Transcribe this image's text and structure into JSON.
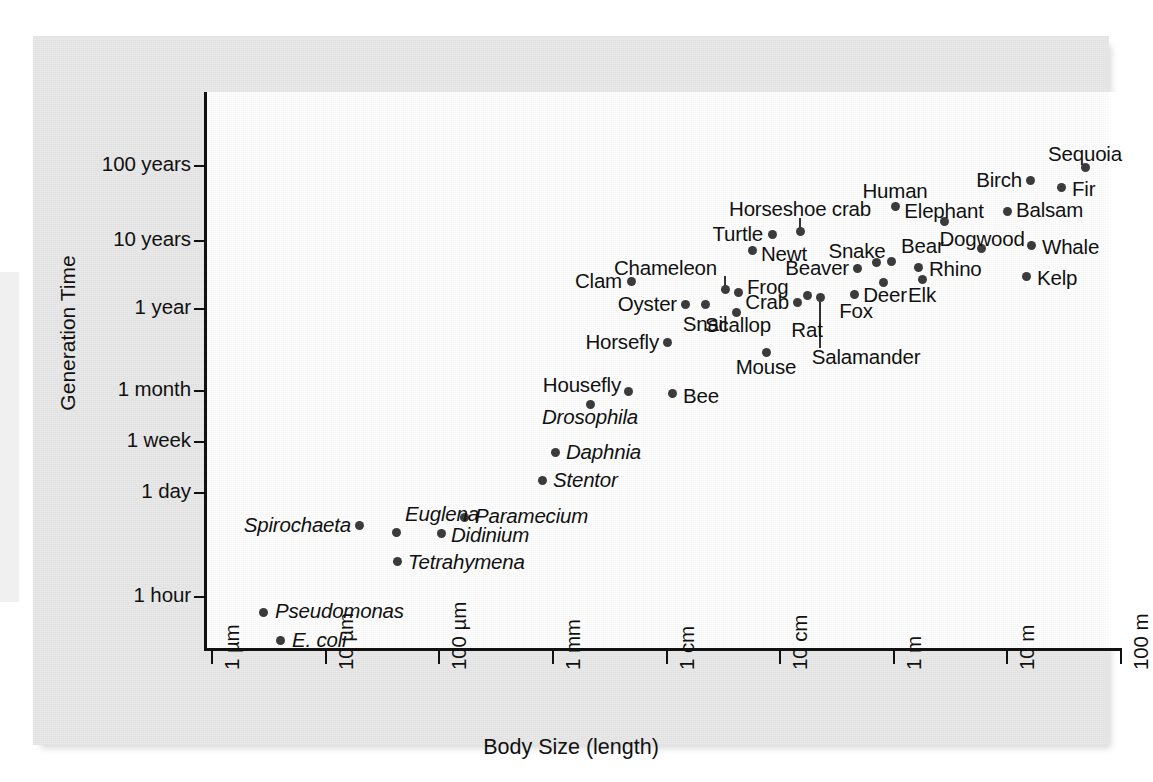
{
  "chart_data": {
    "type": "scatter",
    "title": "",
    "xlabel": "Body Size (length)",
    "ylabel": "Generation Time",
    "grid": false,
    "legend": "none",
    "x_scale": "log",
    "y_scale": "log",
    "x_tick_labels": [
      "1 µm",
      "10 µm",
      "100 µm",
      "1 mm",
      "1 cm",
      "10 cm",
      "1 m",
      "10 m",
      "100 m"
    ],
    "y_tick_labels": [
      "100 years",
      "10 years",
      "1 year",
      "1 month",
      "1 week",
      "1 day",
      "1 hour"
    ],
    "xlim": [
      "1 µm",
      "100 m"
    ],
    "ylim": [
      "below 1 hour",
      "above 100 years"
    ],
    "point_color": "#3c3c3c",
    "panel_color": "#e9e9e9",
    "plot_color": "#ffffff",
    "axis_color": "#111111",
    "points": [
      {
        "name": "E. coli",
        "italic": true,
        "px": 247,
        "py": 604,
        "lx": 259,
        "ly": 604,
        "anchor": "left"
      },
      {
        "name": "Pseudomonas",
        "italic": true,
        "px": 230,
        "py": 576,
        "lx": 242,
        "ly": 575,
        "anchor": "left"
      },
      {
        "name": "Spirochaeta",
        "italic": true,
        "px": 326,
        "py": 489,
        "lx": 318,
        "ly": 489,
        "anchor": "right"
      },
      {
        "name": "Euglena",
        "italic": true,
        "px": 363,
        "py": 496,
        "lx": 372,
        "ly": 478,
        "anchor": "left"
      },
      {
        "name": "Tetrahymena",
        "italic": true,
        "px": 364,
        "py": 525,
        "lx": 375,
        "ly": 526,
        "anchor": "left"
      },
      {
        "name": "Didinium",
        "italic": true,
        "px": 408,
        "py": 497,
        "lx": 418,
        "ly": 499,
        "anchor": "left"
      },
      {
        "name": "Paramecium",
        "italic": true,
        "px": 431,
        "py": 481,
        "lx": 442,
        "ly": 480,
        "anchor": "left"
      },
      {
        "name": "Stentor",
        "italic": true,
        "px": 509,
        "py": 444,
        "lx": 520,
        "ly": 444,
        "anchor": "left"
      },
      {
        "name": "Daphnia",
        "italic": true,
        "px": 522,
        "py": 416,
        "lx": 533,
        "ly": 416,
        "anchor": "left"
      },
      {
        "name": "Drosophila",
        "italic": true,
        "px": 557,
        "py": 368,
        "lx": 557,
        "ly": 381,
        "anchor": "center"
      },
      {
        "name": "Housefly",
        "italic": false,
        "px": 595,
        "py": 355,
        "lx": 588,
        "ly": 349,
        "anchor": "right"
      },
      {
        "name": "Bee",
        "italic": false,
        "px": 639,
        "py": 357,
        "lx": 650,
        "ly": 360,
        "anchor": "left"
      },
      {
        "name": "Horsefly",
        "italic": false,
        "px": 634,
        "py": 306,
        "lx": 626,
        "ly": 306,
        "anchor": "right"
      },
      {
        "name": "Clam",
        "italic": false,
        "px": 598,
        "py": 245,
        "lx": 589,
        "ly": 245,
        "anchor": "right"
      },
      {
        "name": "Oyster",
        "italic": false,
        "px": 652,
        "py": 268,
        "lx": 644,
        "ly": 268,
        "anchor": "right"
      },
      {
        "name": "Snail",
        "italic": false,
        "px": 672,
        "py": 268,
        "lx": 672,
        "ly": 288,
        "anchor": "center"
      },
      {
        "name": "Scallop",
        "italic": false,
        "px": 703,
        "py": 276,
        "lx": 705,
        "ly": 289,
        "anchor": "center"
      },
      {
        "name": "Chameleon",
        "italic": false,
        "px": 692,
        "py": 253,
        "lx": 684,
        "ly": 232,
        "anchor": "right"
      },
      {
        "name": "Frog",
        "italic": false,
        "px": 705,
        "py": 256,
        "lx": 714,
        "ly": 251,
        "anchor": "left"
      },
      {
        "name": "Crab",
        "italic": false,
        "px": 764,
        "py": 266,
        "lx": 756,
        "ly": 266,
        "anchor": "right"
      },
      {
        "name": "Mouse",
        "italic": false,
        "px": 733,
        "py": 316,
        "lx": 733,
        "ly": 331,
        "anchor": "center"
      },
      {
        "name": "Rat",
        "italic": false,
        "px": 774,
        "py": 259,
        "lx": 774,
        "ly": 294,
        "anchor": "center"
      },
      {
        "name": "Salamander",
        "italic": false,
        "px": 787,
        "py": 261,
        "lx": 833,
        "ly": 321,
        "anchor": "center"
      },
      {
        "name": "Newt",
        "italic": false,
        "px": 719,
        "py": 214,
        "lx": 728,
        "ly": 218,
        "anchor": "left"
      },
      {
        "name": "Turtle",
        "italic": false,
        "px": 739,
        "py": 198,
        "lx": 730,
        "ly": 198,
        "anchor": "right"
      },
      {
        "name": "Horseshoe crab",
        "italic": false,
        "px": 767,
        "py": 195,
        "lx": 767,
        "ly": 173,
        "anchor": "center"
      },
      {
        "name": "Beaver",
        "italic": false,
        "px": 824,
        "py": 232,
        "lx": 816,
        "ly": 232,
        "anchor": "right"
      },
      {
        "name": "Snake",
        "italic": false,
        "px": 843,
        "py": 226,
        "lx": 824,
        "ly": 215,
        "anchor": "center"
      },
      {
        "name": "Bear",
        "italic": false,
        "px": 858,
        "py": 225,
        "lx": 868,
        "ly": 210,
        "anchor": "left"
      },
      {
        "name": "Rhino",
        "italic": false,
        "px": 885,
        "py": 231,
        "lx": 896,
        "ly": 233,
        "anchor": "left"
      },
      {
        "name": "Deer",
        "italic": false,
        "px": 850,
        "py": 246,
        "lx": 852,
        "ly": 259,
        "anchor": "center"
      },
      {
        "name": "Elk",
        "italic": false,
        "px": 889,
        "py": 243,
        "lx": 889,
        "ly": 259,
        "anchor": "center"
      },
      {
        "name": "Fox",
        "italic": false,
        "px": 821,
        "py": 258,
        "lx": 823,
        "ly": 275,
        "anchor": "center"
      },
      {
        "name": "Human",
        "italic": false,
        "px": 862,
        "py": 170,
        "lx": 862,
        "ly": 155,
        "anchor": "center"
      },
      {
        "name": "Elephant",
        "italic": false,
        "px": 911,
        "py": 185,
        "lx": 911,
        "ly": 175,
        "anchor": "center"
      },
      {
        "name": "Dogwood",
        "italic": false,
        "px": 948,
        "py": 212,
        "lx": 949,
        "ly": 203,
        "anchor": "center"
      },
      {
        "name": "Balsam",
        "italic": false,
        "px": 974,
        "py": 175,
        "lx": 983,
        "ly": 174,
        "anchor": "left"
      },
      {
        "name": "Whale",
        "italic": false,
        "px": 998,
        "py": 209,
        "lx": 1009,
        "ly": 211,
        "anchor": "left"
      },
      {
        "name": "Kelp",
        "italic": false,
        "px": 993,
        "py": 240,
        "lx": 1004,
        "ly": 242,
        "anchor": "left"
      },
      {
        "name": "Birch",
        "italic": false,
        "px": 997,
        "py": 144,
        "lx": 989,
        "ly": 144,
        "anchor": "right"
      },
      {
        "name": "Fir",
        "italic": false,
        "px": 1028,
        "py": 151,
        "lx": 1039,
        "ly": 153,
        "anchor": "left"
      },
      {
        "name": "Sequoia",
        "italic": false,
        "px": 1052,
        "py": 131,
        "lx": 1052,
        "ly": 118,
        "anchor": "center"
      }
    ],
    "leaders": [
      {
        "name": "chameleon-leader",
        "x": 692,
        "y_top": 240,
        "y_bottom": 253
      },
      {
        "name": "horseshoe-crab-leader",
        "x": 767,
        "y_top": 182,
        "y_bottom": 195
      },
      {
        "name": "salamander-leader",
        "x": 787,
        "y_top": 261,
        "y_bottom": 312
      }
    ],
    "y_ticks": [
      {
        "label": "100 years",
        "y": 130
      },
      {
        "label": "10 years",
        "y": 205
      },
      {
        "label": "1 year",
        "y": 273
      },
      {
        "label": "1 month",
        "y": 355
      },
      {
        "label": "1 week",
        "y": 406
      },
      {
        "label": "1 day",
        "y": 457
      },
      {
        "label": "1 hour",
        "y": 561
      }
    ],
    "x_ticks": [
      {
        "label": "1 µm",
        "x": 179
      },
      {
        "label": "10 µm",
        "x": 293
      },
      {
        "label": "100 µm",
        "x": 406
      },
      {
        "label": "1 mm",
        "x": 520
      },
      {
        "label": "1 cm",
        "x": 634
      },
      {
        "label": "10 cm",
        "x": 747
      },
      {
        "label": "1 m",
        "x": 861
      },
      {
        "label": "10 m",
        "x": 974
      },
      {
        "label": "100 m",
        "x": 1088
      }
    ]
  }
}
